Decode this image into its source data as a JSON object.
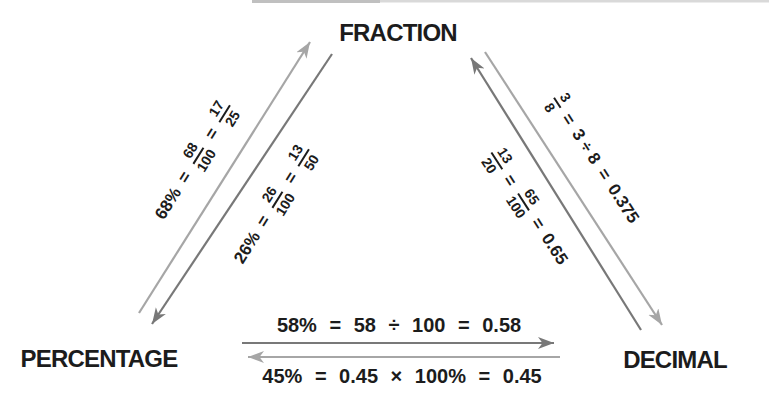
{
  "diagram_title": "Fraction / Percentage / Decimal conversion triangle",
  "nodes": {
    "fraction": "FRACTION",
    "percentage": "PERCENTAGE",
    "decimal": "DECIMAL"
  },
  "conversions": {
    "percent_to_fraction": {
      "lhs": "68%",
      "eq1": "=",
      "frac1": {
        "n": "68",
        "d": "100"
      },
      "eq2": "=",
      "frac2": {
        "n": "17",
        "d": "25"
      }
    },
    "fraction_to_percent": {
      "lhs": "26%",
      "eq1": "=",
      "frac1": {
        "n": "26",
        "d": "100"
      },
      "eq2": "=",
      "frac2": {
        "n": "13",
        "d": "50"
      }
    },
    "fraction_to_decimal": {
      "frac1": {
        "n": "3",
        "d": "8"
      },
      "eq1": "=",
      "mid": "3 ÷ 8",
      "eq2": "=",
      "result": "0.375"
    },
    "decimal_to_fraction": {
      "frac1": {
        "n": "13",
        "d": "20"
      },
      "eq1": "=",
      "frac2": {
        "n": "65",
        "d": "100"
      },
      "eq2": "=",
      "result": "0.65"
    },
    "percent_to_decimal": {
      "text": "58% = 58 ÷ 100 = 0.58"
    },
    "decimal_to_percent": {
      "text": "45% = 0.45 × 100% = 0.45"
    }
  },
  "colors": {
    "ink": "#1c1c1c",
    "arrow_dark": "#787878",
    "arrow_light": "#a6a6a6"
  }
}
